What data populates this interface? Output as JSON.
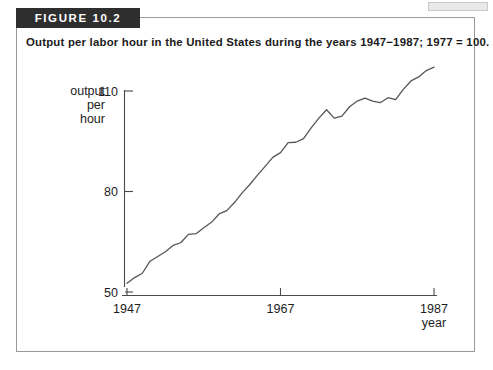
{
  "figure": {
    "banner_label": "FIGURE 10.2",
    "caption": "Output per labor hour in the United States during the years 1947−1987; 1977 = 100."
  },
  "colors": {
    "banner_background": "#2e2e2e",
    "banner_text": "#ffffff",
    "panel_border": "#9a9a9a",
    "axis": "#4a4a4a",
    "data_line": "#565656",
    "text": "#1d1d1d",
    "background": "#ffffff"
  },
  "chart_data": {
    "type": "line",
    "title": "",
    "xlabel": "year",
    "ylabel": "output per hour",
    "ylabel_lines": [
      "output",
      "per",
      "hour"
    ],
    "xlim": [
      1947,
      1987
    ],
    "ylim": [
      50,
      110
    ],
    "yticks": [
      50,
      80,
      110
    ],
    "ytick_labels": [
      "50",
      "80",
      "110"
    ],
    "xticks": [
      1947,
      1967,
      1987
    ],
    "xtick_labels": [
      "1947",
      "1967",
      "1987"
    ],
    "grid": false,
    "legend": "none",
    "x": [
      1947,
      1948,
      1949,
      1950,
      1951,
      1952,
      1953,
      1954,
      1955,
      1956,
      1957,
      1958,
      1959,
      1960,
      1961,
      1962,
      1963,
      1964,
      1965,
      1966,
      1967,
      1968,
      1969,
      1970,
      1971,
      1972,
      1973,
      1974,
      1975,
      1976,
      1977,
      1978,
      1979,
      1980,
      1981,
      1982,
      1983,
      1984,
      1985,
      1986,
      1987
    ],
    "values": [
      52.6,
      54.3,
      55.6,
      59.2,
      60.6,
      62.0,
      63.9,
      64.7,
      67.2,
      67.4,
      69.2,
      70.8,
      73.3,
      74.3,
      76.7,
      79.6,
      82.1,
      84.9,
      87.5,
      90.2,
      91.6,
      94.6,
      94.7,
      95.8,
      99.0,
      101.9,
      104.4,
      101.9,
      102.5,
      105.3,
      107.0,
      107.9,
      107.0,
      106.5,
      108.0,
      107.4,
      110.5,
      113.0,
      114.2,
      116.1,
      117.1
    ],
    "series_name": "Output per labor hour (1977 = 100)"
  }
}
